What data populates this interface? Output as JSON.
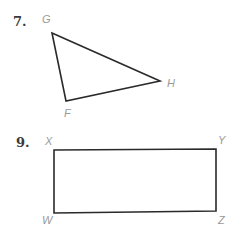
{
  "problems": [
    {
      "number": "7.",
      "shape": "triangle",
      "vertices": {
        "G": "G",
        "H": "H",
        "F": "F"
      }
    },
    {
      "number": "9.",
      "shape": "rectangle",
      "vertices": {
        "X": "X",
        "Y": "Y",
        "W": "W",
        "Z": "Z"
      }
    }
  ],
  "colors": {
    "stroke": "#2a2a2a",
    "label": "#9a9a9a",
    "number": "#3a3a3a"
  }
}
